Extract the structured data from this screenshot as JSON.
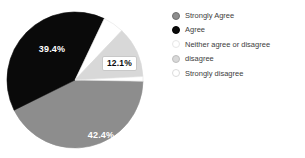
{
  "chart_data": {
    "type": "pie",
    "title": "",
    "categories": [
      "Strongly Agree",
      "Agree",
      "Neither agree or disagree",
      "disagree",
      "Strongly disagree"
    ],
    "values": [
      42.4,
      39.4,
      5.0,
      12.1,
      1.1
    ],
    "slice_labels": [
      "42.4%",
      "39.4%",
      "",
      "12.1%",
      ""
    ],
    "labeled_slices": {
      "Strongly Agree": "42.4%",
      "Agree": "39.4%",
      "disagree": "12.1%"
    },
    "estimated_unlabeled_slices": [
      "Neither agree or disagree",
      "Strongly disagree"
    ],
    "colors": [
      "#8d8d8d",
      "#0a0a0a",
      "#ffffff",
      "#d8d8d8",
      "#ffffff"
    ],
    "slice_strokes": [
      "#8d8d8d",
      "#0a0a0a",
      "#e2e2e2",
      "#d8d8d8",
      "#e2e2e2"
    ],
    "marker_borders": [
      "#6e6e6e",
      "#000000",
      "#e6e6e6",
      "#bdbdbd",
      "#dcdcdc"
    ],
    "start_angle_deg": 91,
    "direction": "clockwise",
    "legend_position": "right",
    "background": "#ffffff",
    "label_text_color_on_dark": "#ffffff",
    "boxed_label_border": "#c8c8c8"
  }
}
